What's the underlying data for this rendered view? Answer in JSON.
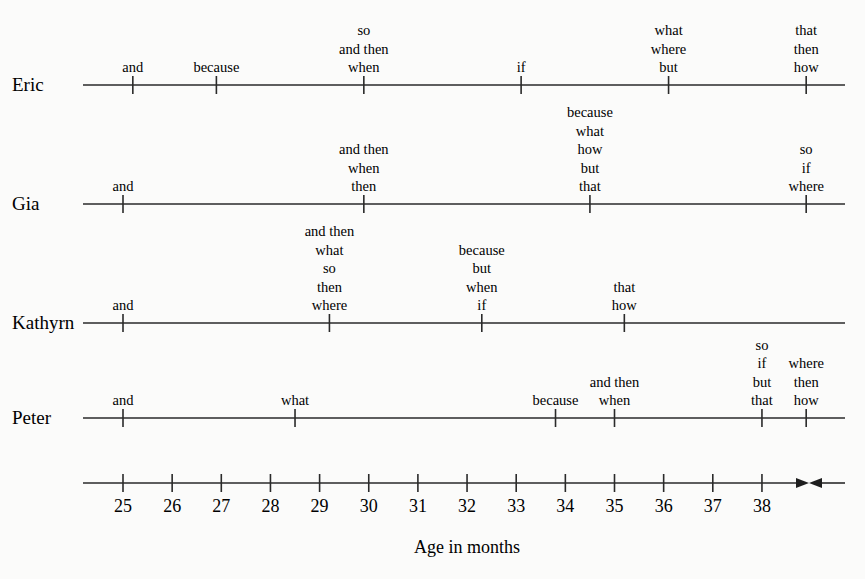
{
  "chart_data": {
    "type": "timeline",
    "title": "",
    "xlabel": "Age in months",
    "ylabel": "",
    "x_ticks": [
      25,
      26,
      27,
      28,
      29,
      30,
      31,
      32,
      33,
      34,
      35,
      36,
      37,
      38
    ],
    "x_range": [
      24.2,
      39.7
    ],
    "axis_break_marker": "converging arrows after 38 (axis break)",
    "grid": false,
    "legend": null,
    "series": [
      {
        "name": "Eric",
        "events": [
          {
            "age": 25.2,
            "words": [
              "and"
            ]
          },
          {
            "age": 26.9,
            "words": [
              "because"
            ]
          },
          {
            "age": 29.9,
            "words": [
              "so",
              "and then",
              "when"
            ]
          },
          {
            "age": 33.1,
            "words": [
              "if"
            ]
          },
          {
            "age": 36.1,
            "words": [
              "what",
              "where",
              "but"
            ]
          },
          {
            "age": 38.9,
            "words": [
              "that",
              "then",
              "how"
            ]
          }
        ]
      },
      {
        "name": "Gia",
        "events": [
          {
            "age": 25.0,
            "words": [
              "and"
            ]
          },
          {
            "age": 29.9,
            "words": [
              "and then",
              "when",
              "then"
            ]
          },
          {
            "age": 34.5,
            "words": [
              "because",
              "what",
              "how",
              "but",
              "that"
            ]
          },
          {
            "age": 38.9,
            "words": [
              "so",
              "if",
              "where"
            ]
          }
        ]
      },
      {
        "name": "Kathyrn",
        "events": [
          {
            "age": 25.0,
            "words": [
              "and"
            ]
          },
          {
            "age": 29.2,
            "words": [
              "and then",
              "what",
              "so",
              "then",
              "where"
            ]
          },
          {
            "age": 32.3,
            "words": [
              "because",
              "but",
              "when",
              "if"
            ]
          },
          {
            "age": 35.2,
            "words": [
              "that",
              "how"
            ]
          }
        ]
      },
      {
        "name": "Peter",
        "events": [
          {
            "age": 25.0,
            "words": [
              "and"
            ]
          },
          {
            "age": 28.5,
            "words": [
              "what"
            ]
          },
          {
            "age": 33.8,
            "words": [
              "because"
            ]
          },
          {
            "age": 35.0,
            "words": [
              "and then",
              "when"
            ]
          },
          {
            "age": 38.0,
            "words": [
              "so",
              "if",
              "but",
              "that"
            ]
          },
          {
            "age": 38.9,
            "words": [
              "where",
              "then",
              "how"
            ]
          }
        ]
      }
    ]
  },
  "layout": {
    "row_y": [
      85,
      204,
      323,
      418
    ],
    "axis_y": 483,
    "line_x_start": 83,
    "line_x_end": 845,
    "x0_px": 123,
    "x0_month": 25,
    "px_per_month": 49.15,
    "line_height": 18.5
  },
  "colors": {
    "ink": "#2a2a2a",
    "text": "#1e1e1e",
    "background": "#fbfbfa"
  }
}
